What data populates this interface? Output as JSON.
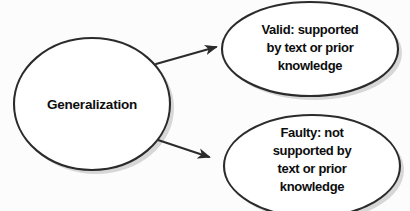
{
  "diagram": {
    "type": "concept-map",
    "background_color": "#fcfcfc",
    "node_fill_color": "#ffffff",
    "node_stroke_color": "#2b2b2b",
    "text_color": "#0d0d0d",
    "shadow_color": "#b8b8b8",
    "root": {
      "id": "generalization",
      "label": "Generalization",
      "shape": "ellipse",
      "cx": 92,
      "cy": 104,
      "rx": 78,
      "ry": 66
    },
    "branches": [
      {
        "id": "valid",
        "shape": "ellipse",
        "cx": 310,
        "cy": 49,
        "rx": 88,
        "ry": 47,
        "lines": [
          "Valid: supported",
          "by text or prior",
          "knowledge"
        ]
      },
      {
        "id": "faulty",
        "shape": "ellipse",
        "cx": 312,
        "cy": 166,
        "rx": 88,
        "ry": 51,
        "lines": [
          "Faulty: not",
          "supported by",
          "text or prior",
          "knowledge"
        ]
      }
    ],
    "connectors": [
      {
        "id": "root-to-valid",
        "from": "generalization",
        "to": "valid",
        "x1": 156,
        "y1": 64,
        "x2": 221,
        "y2": 47,
        "arrowhead": "end"
      },
      {
        "id": "root-to-faulty",
        "from": "generalization",
        "to": "faulty",
        "x1": 158,
        "y1": 140,
        "x2": 214,
        "y2": 159,
        "arrowhead": "end"
      }
    ]
  }
}
